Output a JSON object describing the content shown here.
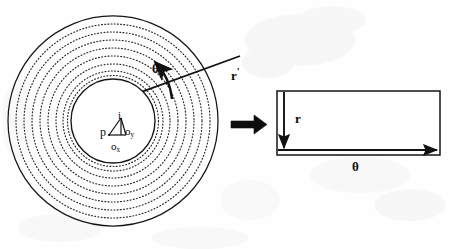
{
  "figure": {
    "background_color": "#ffffff",
    "stroke_color": "#111111",
    "panels": {
      "left": {
        "name": "polar-disc",
        "description": "Concentric circles with radius line and angular sweep",
        "outer_circle": {
          "cx": 113,
          "cy": 121,
          "r": 105
        },
        "inner_circle": {
          "cx": 113,
          "cy": 121,
          "r": 42
        },
        "dotted_ring_count": 8,
        "dotted_ring_radii": [
          97,
          89,
          81,
          73,
          65,
          57,
          50,
          45
        ]
      },
      "right": {
        "name": "unwrapped-rectangle",
        "rect": {
          "x": 277,
          "y": 91,
          "w": 163,
          "h": 64
        }
      }
    },
    "labels": {
      "theta_polar": "θ",
      "r_prime": "r",
      "r_prime_mark": "'",
      "origin_point": "p",
      "intensity": "i",
      "offset_y_base": "o",
      "offset_y_sub": "y",
      "offset_x_base": "o",
      "offset_x_sub": "x",
      "r_rect": "r",
      "theta_rect": "θ"
    },
    "arrows": {
      "transform_arrow": "thick-right-arrow",
      "radius_arrow": "radius-line-arrow",
      "sweep_arrow": "theta-arc-arrow",
      "rect_vertical_arrow": "r-down-arrow",
      "rect_horizontal_arrow": "theta-right-arrow"
    },
    "colors": {
      "ink": "#111111",
      "paper": "#ffffff",
      "dotted": "#2b2b2b"
    }
  }
}
